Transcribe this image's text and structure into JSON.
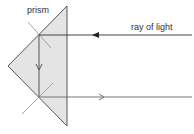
{
  "diagram": {
    "type": "optics-total-internal-reflection",
    "labels": {
      "prism": "prism",
      "ray": "ray of light"
    },
    "colors": {
      "prism_fill": "#e4e4e4",
      "prism_edge": "#555555",
      "ray": "#555555",
      "normal": "#9a9a9a",
      "text": "#333333"
    },
    "prism": {
      "vertices": [
        [
          67,
          6
        ],
        [
          8,
          66
        ],
        [
          67,
          126
        ]
      ]
    },
    "rays": [
      {
        "name": "incoming",
        "from": [
          192,
          35
        ],
        "to": [
          39,
          35
        ],
        "direction": "left"
      },
      {
        "name": "reflected-down",
        "from": [
          39,
          35
        ],
        "to": [
          39,
          97
        ],
        "direction": "down"
      },
      {
        "name": "outgoing",
        "from": [
          39,
          97
        ],
        "to": [
          192,
          97
        ],
        "direction": "right"
      }
    ],
    "normals": [
      {
        "at": [
          39,
          35
        ],
        "from": [
          28,
          22
        ],
        "to": [
          51,
          48
        ]
      },
      {
        "at": [
          39,
          97
        ],
        "from": [
          22,
          114
        ],
        "to": [
          53,
          83
        ]
      }
    ]
  }
}
